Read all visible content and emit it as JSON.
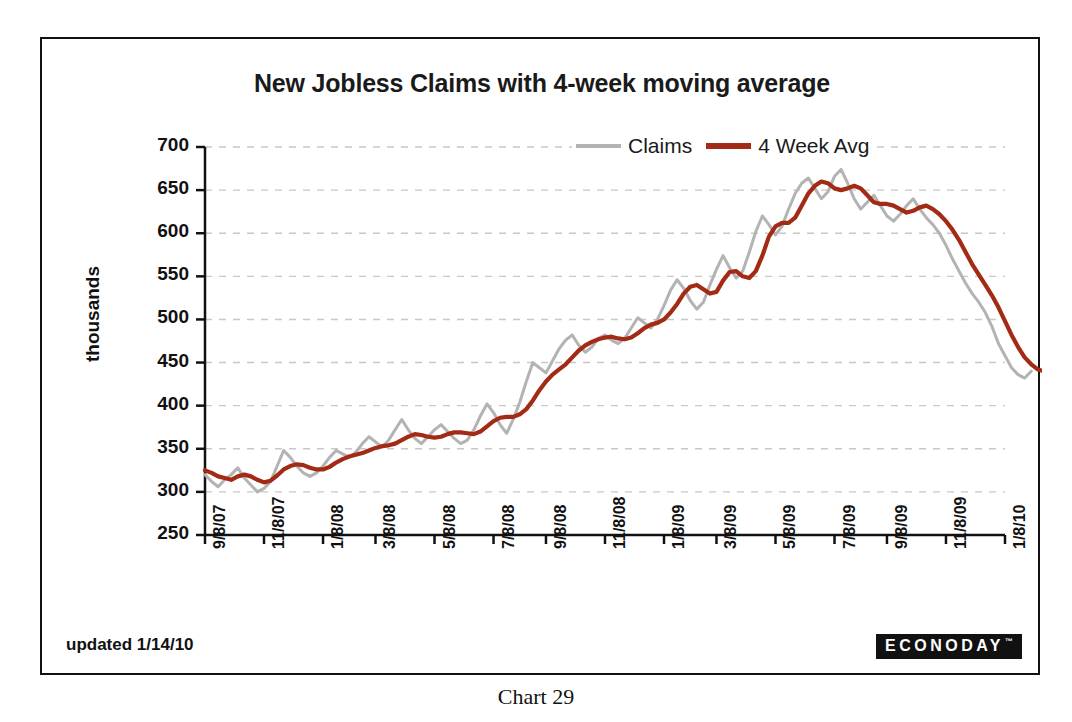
{
  "caption": "Chart 29",
  "updated_note": "updated 1/14/10",
  "branding": {
    "logo_text": "ECONODAY",
    "logo_tm": "™"
  },
  "colors": {
    "claims": "#b3b3b3",
    "moving_average": "#a32b15",
    "grid": "#c8c8c8",
    "axis": "#111111",
    "frame": "#111111",
    "background": "#ffffff"
  },
  "legend": {
    "position": "top-center",
    "items": [
      {
        "label": "Claims",
        "color": "#b3b3b3"
      },
      {
        "label": "4 Week Avg",
        "color": "#a32b15"
      }
    ]
  },
  "chart_data": {
    "type": "line",
    "title": "New Jobless Claims with 4-week moving average",
    "xlabel": "",
    "ylabel": "thousands",
    "ylim": [
      250,
      700
    ],
    "ytick_step": 50,
    "yticks": [
      250,
      300,
      350,
      400,
      450,
      500,
      550,
      600,
      650,
      700
    ],
    "ytick_labels": [
      "250",
      "300",
      "350",
      "400",
      "450",
      "500",
      "550",
      "600",
      "650",
      "700"
    ],
    "grid": true,
    "grid_style": "dashed-horizontal",
    "xtick_labels": [
      "9/8/07",
      "11/8/07",
      "1/8/08",
      "3/8/08",
      "5/8/08",
      "7/8/08",
      "9/8/08",
      "11/8/08",
      "1/8/09",
      "3/8/09",
      "5/8/09",
      "7/8/09",
      "9/8/09",
      "11/8/09",
      "1/8/10"
    ],
    "xtick_index": [
      0,
      9,
      18,
      26,
      35,
      44,
      52,
      61,
      70,
      78,
      87,
      96,
      104,
      113,
      122
    ],
    "n_points": 123,
    "series": [
      {
        "name": "Claims",
        "color": "#b3b3b3",
        "values": [
          320,
          312,
          306,
          314,
          320,
          328,
          316,
          308,
          300,
          304,
          312,
          330,
          348,
          340,
          330,
          322,
          318,
          322,
          330,
          340,
          348,
          344,
          340,
          346,
          356,
          364,
          358,
          352,
          360,
          372,
          384,
          372,
          362,
          356,
          364,
          372,
          378,
          370,
          362,
          356,
          360,
          372,
          388,
          402,
          392,
          378,
          368,
          384,
          404,
          428,
          450,
          444,
          438,
          452,
          466,
          476,
          482,
          470,
          462,
          468,
          478,
          482,
          476,
          472,
          478,
          490,
          502,
          496,
          490,
          500,
          516,
          534,
          546,
          536,
          522,
          512,
          520,
          540,
          558,
          574,
          560,
          548,
          556,
          578,
          602,
          620,
          610,
          598,
          608,
          628,
          646,
          658,
          664,
          652,
          640,
          648,
          666,
          674,
          658,
          640,
          628,
          636,
          644,
          632,
          620,
          614,
          622,
          632,
          640,
          628,
          618,
          610,
          600,
          586,
          570,
          556,
          542,
          530,
          520,
          508,
          492,
          472,
          458,
          444,
          436,
          432,
          440
        ],
        "note": "weekly initial claims, thousands"
      },
      {
        "name": "4 Week Avg",
        "color": "#a32b15",
        "values": [
          325,
          322,
          318,
          316,
          314,
          318,
          320,
          318,
          314,
          311,
          313,
          319,
          326,
          330,
          332,
          331,
          328,
          326,
          326,
          329,
          334,
          338,
          341,
          343,
          345,
          348,
          351,
          353,
          354,
          356,
          360,
          364,
          367,
          366,
          364,
          363,
          364,
          367,
          369,
          369,
          368,
          367,
          370,
          376,
          382,
          386,
          387,
          387,
          390,
          396,
          406,
          418,
          428,
          436,
          442,
          448,
          456,
          464,
          470,
          474,
          477,
          479,
          480,
          478,
          477,
          479,
          484,
          490,
          494,
          496,
          500,
          508,
          518,
          530,
          538,
          540,
          535,
          530,
          532,
          545,
          555,
          556,
          550,
          548,
          556,
          574,
          596,
          608,
          612,
          612,
          618,
          632,
          646,
          655,
          660,
          658,
          652,
          650,
          652,
          655,
          652,
          644,
          636,
          634,
          634,
          632,
          628,
          624,
          626,
          630,
          632,
          628,
          622,
          614,
          604,
          592,
          578,
          564,
          552,
          540,
          528,
          514,
          498,
          482,
          468,
          456,
          448,
          442,
          440
        ],
        "note": "4-week moving average of initial claims, thousands"
      }
    ]
  }
}
